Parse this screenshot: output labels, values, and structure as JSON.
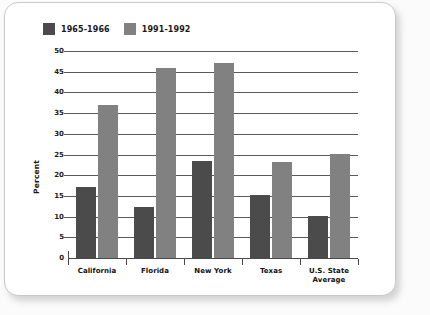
{
  "chart_data": {
    "type": "bar",
    "title": "",
    "xlabel": "",
    "ylabel": "Percent",
    "ylim": [
      0,
      50
    ],
    "ytick_step": 5,
    "yticks": [
      "50",
      "45",
      "40",
      "35",
      "30",
      "25",
      "20",
      "15",
      "10",
      "5",
      "0"
    ],
    "grid": true,
    "legend_position": "top-left",
    "categories": [
      "California",
      "Florida",
      "New York",
      "Texas",
      "U.S. State\nAverage"
    ],
    "category_lines": [
      [
        "California"
      ],
      [
        "Florida"
      ],
      [
        "New York"
      ],
      [
        "Texas"
      ],
      [
        "U.S. State",
        "Average"
      ]
    ],
    "series": [
      {
        "name": "1965-1966",
        "color": "#4b4b4b",
        "values": [
          17.2,
          12.4,
          23.4,
          15.3,
          10.2
        ]
      },
      {
        "name": "1991-1992",
        "color": "#818181",
        "values": [
          37.0,
          46.0,
          47.0,
          23.1,
          25.1
        ]
      }
    ]
  },
  "legend": {
    "items": [
      {
        "label": "1965-1966",
        "swatch": "legend-swatch-dark"
      },
      {
        "label": "1991-1992",
        "swatch": "legend-swatch-light"
      }
    ]
  },
  "colors": {
    "series_1965": "#4b4b4b",
    "series_1991": "#818181",
    "gridline": "#5a5a5a",
    "axis": "#4a4a4a",
    "text": "#111111",
    "card_background": "#ffffff",
    "card_border": "#c9c9c9",
    "page_background": "#fbfbfb"
  }
}
